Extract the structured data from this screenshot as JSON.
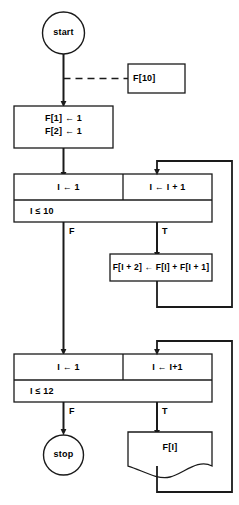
{
  "diagram": {
    "stroke_color": "#1a1a1a",
    "fill_color": "#ffffff",
    "background_color": "#ffffff"
  },
  "nodes": {
    "start": {
      "label": "start",
      "shape": "circle"
    },
    "declaration": {
      "label": "F[10]",
      "shape": "rectangle",
      "connector": "dashed"
    },
    "init": {
      "line1": "F[1] ← 1",
      "line2": "F[2] ← 1",
      "shape": "process"
    },
    "loop1": {
      "init": "I ← 1",
      "increment": "I ← I + 1",
      "condition": "I ≤ 10",
      "shape": "loop"
    },
    "body1": {
      "label": "F[I + 2] ← F[I] + F[I + 1]",
      "shape": "process"
    },
    "loop2": {
      "init": "I ← 1",
      "increment": "I ← I+1",
      "condition": "I ≤ 12",
      "shape": "loop"
    },
    "output": {
      "label": "F[I]",
      "shape": "document"
    },
    "stop": {
      "label": "stop",
      "shape": "circle"
    }
  },
  "branch_labels": {
    "loop1_false": "F",
    "loop1_true": "T",
    "loop2_false": "F",
    "loop2_true": "T"
  }
}
